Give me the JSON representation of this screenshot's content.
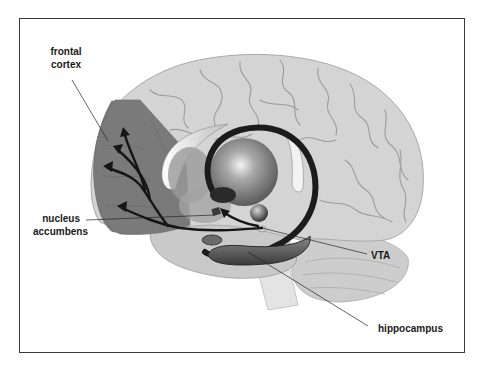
{
  "figure": {
    "labels": {
      "frontal_cortex_line1": "frontal",
      "frontal_cortex_line2": "cortex",
      "nucleus_accumbens_line1": "nucleus",
      "nucleus_accumbens_line2": "accumbens",
      "vta": "VTA",
      "hippocampus": "hippocampus"
    },
    "colors": {
      "brain": "#d2d2d2",
      "brain_sulci": "#9c9c9c",
      "frontal_cortex": "#7a7a7a",
      "pathway": "#1c1c1c",
      "frame": "#3a3a3a",
      "label_text": "#1a1a1a"
    }
  }
}
